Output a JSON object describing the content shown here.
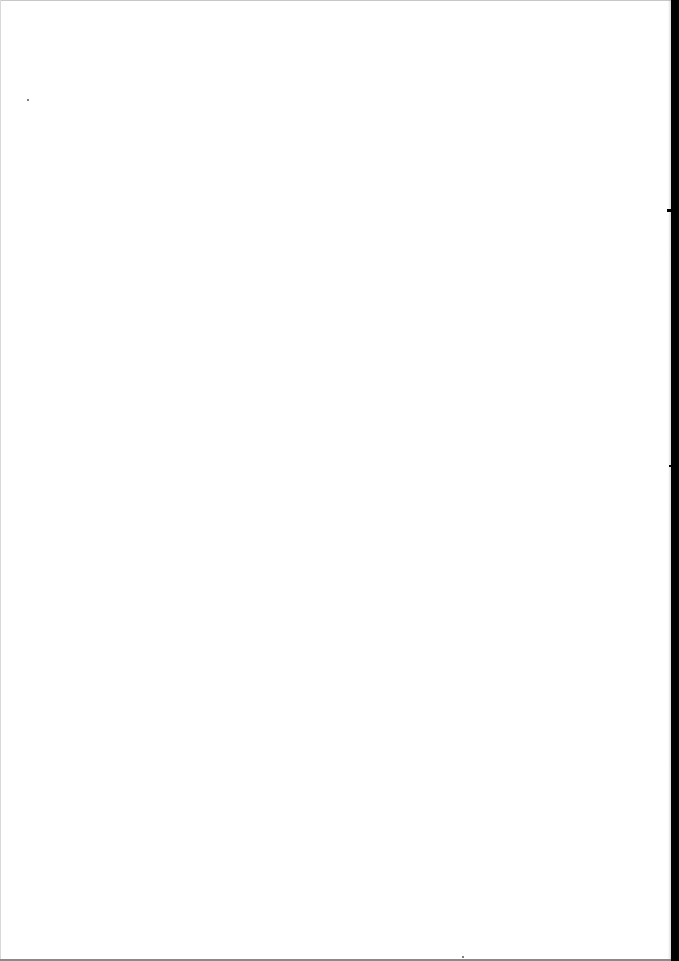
{
  "document": {
    "type": "scanned-blank-page",
    "text_content": ""
  },
  "colors": {
    "paper": "#ffffff",
    "scan_edge": "#000000"
  }
}
